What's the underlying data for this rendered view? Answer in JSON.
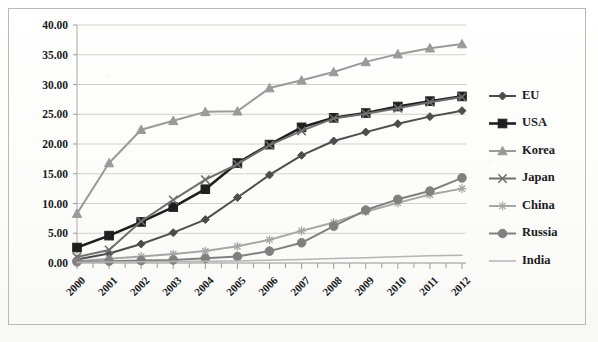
{
  "chart_data": {
    "type": "line",
    "title": "",
    "subtitle": "",
    "xlabel": "",
    "ylabel": "",
    "xlim": [
      2000,
      2012
    ],
    "ylim": [
      0.0,
      40.0
    ],
    "ytick_step": 5.0,
    "grid": true,
    "legend_position": "right",
    "categories": [
      "2000",
      "2001",
      "2002",
      "2003",
      "2004",
      "2005",
      "2006",
      "2007",
      "2008",
      "2009",
      "2010",
      "2011",
      "2012"
    ],
    "ytick_labels": [
      "0.00",
      "5.00",
      "10.00",
      "15.00",
      "20.00",
      "25.00",
      "30.00",
      "35.00",
      "40.00"
    ],
    "series": [
      {
        "name": "EU",
        "marker": "diamond",
        "color": "#4d4d4d",
        "values": [
          0.6,
          1.6,
          3.2,
          5.1,
          7.3,
          11.0,
          14.8,
          18.1,
          20.5,
          22.0,
          23.4,
          24.6,
          25.6
        ]
      },
      {
        "name": "USA",
        "marker": "square",
        "color": "#1f1f1f",
        "values": [
          2.6,
          4.6,
          6.9,
          9.4,
          12.4,
          16.8,
          19.9,
          22.8,
          24.4,
          25.2,
          26.3,
          27.2,
          28.0
        ]
      },
      {
        "name": "Korea",
        "marker": "triangle",
        "color": "#9a9a9a",
        "values": [
          8.3,
          16.8,
          22.4,
          23.9,
          25.4,
          25.5,
          29.4,
          30.7,
          32.1,
          33.8,
          35.1,
          36.1,
          36.8
        ]
      },
      {
        "name": "Japan",
        "marker": "x",
        "color": "#6f6f6f",
        "values": [
          1.0,
          2.2,
          7.0,
          10.6,
          14.0,
          16.6,
          19.8,
          22.2,
          24.3,
          25.1,
          26.0,
          27.0,
          27.9
        ]
      },
      {
        "name": "China",
        "marker": "asterisk",
        "color": "#a6a6a6",
        "values": [
          0.3,
          0.7,
          1.1,
          1.5,
          2.0,
          2.8,
          3.9,
          5.4,
          6.8,
          8.6,
          10.1,
          11.5,
          12.5
        ]
      },
      {
        "name": "Russia",
        "marker": "circle",
        "color": "#808080",
        "values": [
          0.2,
          0.3,
          0.4,
          0.5,
          0.8,
          1.1,
          2.0,
          3.4,
          6.2,
          8.9,
          10.7,
          12.1,
          14.3
        ]
      },
      {
        "name": "India",
        "marker": "none",
        "color": "#b4b4b4",
        "values": [
          0.1,
          0.15,
          0.2,
          0.25,
          0.3,
          0.35,
          0.45,
          0.6,
          0.75,
          0.9,
          1.05,
          1.2,
          1.3
        ]
      }
    ]
  },
  "legend": {
    "entries": [
      {
        "label": "EU"
      },
      {
        "label": "USA"
      },
      {
        "label": "Korea"
      },
      {
        "label": "Japan"
      },
      {
        "label": "China"
      },
      {
        "label": "Russia"
      },
      {
        "label": "India"
      }
    ]
  }
}
